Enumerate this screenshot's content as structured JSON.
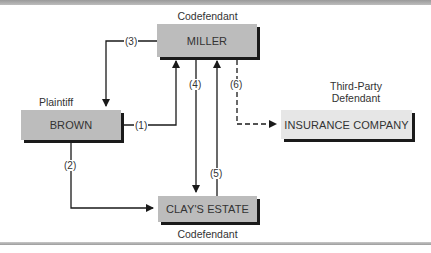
{
  "diagram": {
    "nodes": {
      "miller": {
        "name": "MILLER",
        "role": "Codefendant"
      },
      "brown": {
        "name": "BROWN",
        "role": "Plaintiff"
      },
      "clays_estate": {
        "name": "CLAY'S ESTATE",
        "role": "Codefendant"
      },
      "insurance": {
        "name": "INSURANCE COMPANY",
        "role_line1": "Third-Party",
        "role_line2": "Defendant"
      }
    },
    "edges": [
      {
        "label": "(1)",
        "from": "BROWN",
        "to": "MILLER",
        "style": "solid"
      },
      {
        "label": "(2)",
        "from": "BROWN",
        "to": "CLAY'S ESTATE",
        "style": "solid"
      },
      {
        "label": "(3)",
        "from": "MILLER",
        "to": "BROWN",
        "style": "solid"
      },
      {
        "label": "(4)",
        "from": "MILLER",
        "to": "CLAY'S ESTATE",
        "style": "solid"
      },
      {
        "label": "(5)",
        "from": "CLAY'S ESTATE",
        "to": "MILLER",
        "style": "solid"
      },
      {
        "label": "(6)",
        "from": "MILLER",
        "to": "INSURANCE COMPANY",
        "style": "dashed"
      }
    ],
    "colors": {
      "box": "#bcbcbc",
      "box_light": "#e6e6e6",
      "shadow": "#1a1a1a",
      "line": "#1a1a1a"
    }
  }
}
